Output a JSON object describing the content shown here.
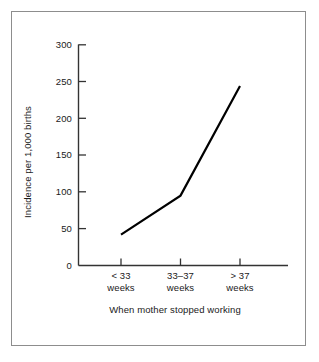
{
  "chart_data": {
    "type": "line",
    "title": "",
    "subtitle": "",
    "xlabel": "When mother stopped working",
    "ylabel": "Incidence per 1,000 births",
    "categories": [
      "< 33\nweeks",
      "33–37\nweeks",
      "> 37\nweeks"
    ],
    "category_lines": [
      {
        "line1": "< 33",
        "line2": "weeks"
      },
      {
        "line1": "33–37",
        "line2": "weeks"
      },
      {
        "line1": "> 37",
        "line2": "weeks"
      }
    ],
    "series": [
      {
        "name": "Incidence per 1,000 births",
        "values": [
          42,
          95,
          244
        ],
        "color": "#000000"
      }
    ],
    "ylim": [
      0,
      300
    ],
    "yticks": [
      0,
      50,
      100,
      150,
      200,
      250,
      300
    ],
    "ytick_labels": [
      "0",
      "50",
      "100",
      "150",
      "200",
      "250",
      "300"
    ],
    "grid": false,
    "legend": false,
    "legend_position": "none",
    "annotations": [],
    "frame": {
      "border_color": "#8d8d8d",
      "background": "#ffffff"
    },
    "axis_color": "#333333",
    "line_color": "#000000",
    "line_width": 2.2
  }
}
